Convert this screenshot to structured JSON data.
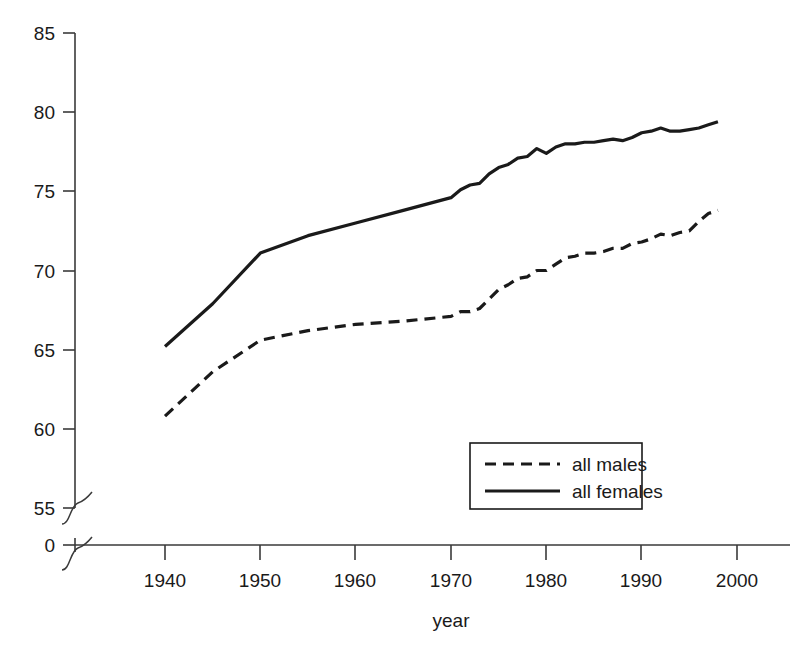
{
  "chart_data": {
    "type": "line",
    "title": "",
    "subtitle": "",
    "xlabel": "year",
    "ylabel": "",
    "xlim": [
      1932,
      2004
    ],
    "ylim": [
      55,
      85
    ],
    "y_axis_break": true,
    "y_break_note": "axis broken between 0 and 55",
    "grid": false,
    "legend_position": "inside-lower-right",
    "xticks": [
      1940,
      1950,
      1960,
      1970,
      1980,
      1990,
      2000
    ],
    "xtick_labels": [
      "1940",
      "1950",
      "1960",
      "1970",
      "1980",
      "1990",
      "2000"
    ],
    "yticks": [
      0,
      55,
      60,
      65,
      70,
      75,
      80,
      85
    ],
    "ytick_labels": [
      "0",
      "55",
      "60",
      "65",
      "70",
      "75",
      "80",
      "85"
    ],
    "series": [
      {
        "name": "all males",
        "style": "dashed",
        "color": "#1a1a1a",
        "x": [
          1940,
          1945,
          1950,
          1955,
          1960,
          1965,
          1970,
          1971,
          1972,
          1973,
          1974,
          1975,
          1976,
          1977,
          1978,
          1979,
          1980,
          1981,
          1982,
          1983,
          1984,
          1985,
          1986,
          1987,
          1988,
          1989,
          1990,
          1991,
          1992,
          1993,
          1994,
          1995,
          1996,
          1997,
          1998
        ],
        "y": [
          60.8,
          63.6,
          65.6,
          66.2,
          66.6,
          66.8,
          67.1,
          67.4,
          67.4,
          67.6,
          68.2,
          68.8,
          69.1,
          69.5,
          69.6,
          70.0,
          70.0,
          70.4,
          70.8,
          70.9,
          71.1,
          71.1,
          71.2,
          71.4,
          71.4,
          71.7,
          71.8,
          72.0,
          72.3,
          72.2,
          72.4,
          72.5,
          73.1,
          73.6,
          73.8
        ]
      },
      {
        "name": "all females",
        "style": "solid",
        "color": "#1a1a1a",
        "x": [
          1940,
          1945,
          1950,
          1955,
          1960,
          1965,
          1970,
          1971,
          1972,
          1973,
          1974,
          1975,
          1976,
          1977,
          1978,
          1979,
          1980,
          1981,
          1982,
          1983,
          1984,
          1985,
          1986,
          1987,
          1988,
          1989,
          1990,
          1991,
          1992,
          1993,
          1994,
          1995,
          1996,
          1997,
          1998
        ],
        "y": [
          65.2,
          67.9,
          71.1,
          72.2,
          73.0,
          73.8,
          74.6,
          75.1,
          75.4,
          75.5,
          76.1,
          76.5,
          76.7,
          77.1,
          77.2,
          77.7,
          77.4,
          77.8,
          78.0,
          78.0,
          78.1,
          78.1,
          78.2,
          78.3,
          78.2,
          78.4,
          78.7,
          78.8,
          79.0,
          78.8,
          78.8,
          78.9,
          79.0,
          79.2,
          79.4
        ]
      }
    ],
    "legend_entries": [
      {
        "label": "all males",
        "style": "dashed"
      },
      {
        "label": "all females",
        "style": "solid"
      }
    ]
  },
  "axes": {
    "x_title": "year",
    "y_title": ""
  }
}
